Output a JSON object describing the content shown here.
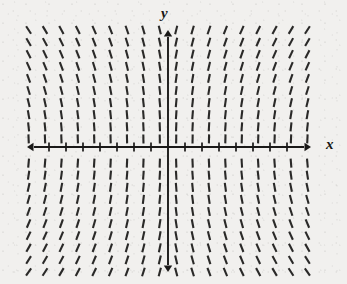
{
  "figure": {
    "kind": "slope-field",
    "corner_label": ")",
    "axis_labels": {
      "x": "x",
      "y": "y"
    },
    "background_color": "#f1f0ee",
    "ink_color": "#1a1918"
  },
  "chart_data": {
    "type": "line",
    "title": "",
    "xlabel": "x",
    "ylabel": "y",
    "grid": false,
    "legend": null,
    "axes": {
      "origin_px": [
        168,
        147
      ],
      "x_axis": {
        "from_px": [
          27,
          147
        ],
        "to_px": [
          311,
          147
        ],
        "arrows": "both",
        "tick_spacing_px": 17,
        "tick_length_px": 9,
        "tick_count": 16
      },
      "y_axis": {
        "from_px": [
          168,
          30
        ],
        "to_px": [
          168,
          272
        ],
        "arrows": "both",
        "tick_spacing_px": 0,
        "tick_count": 0
      }
    },
    "field": {
      "x_range_px": [
        24,
        318
      ],
      "y_range_px": [
        30,
        272
      ],
      "column_spacing_px": 16.4,
      "row_spacing_px": 12.1,
      "columns": 18,
      "rows": 21,
      "dash_length_px": 9,
      "dash_width_px": 2.1,
      "curvature": 0.62,
      "note": "Segment slope magnitude grows with distance from the x-axis and with distance from the y-axis; segments mirror across both axes."
    },
    "series": [
      {
        "name": "curve-family",
        "values": []
      }
    ]
  }
}
